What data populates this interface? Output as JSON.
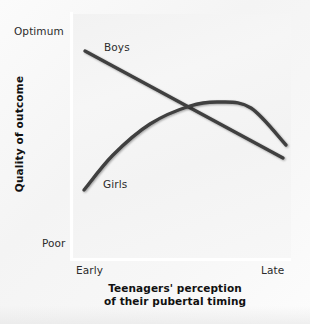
{
  "chart_data": {
    "type": "line",
    "title": "",
    "xlabel": "Teenagers' perception of their pubertal timing",
    "ylabel": "Quality of outcome",
    "x_tick_labels": [
      "Early",
      "Late"
    ],
    "y_tick_labels": [
      "Optimum",
      "Poor"
    ],
    "xlim": [
      "Early",
      "Late"
    ],
    "ylim": [
      "Poor",
      "Optimum"
    ],
    "grid": false,
    "legend_position": "inline-labels",
    "annotations": [
      "Boys",
      "Girls"
    ],
    "series": [
      {
        "name": "Boys",
        "shape": "straight descending line",
        "x": [
          0.06,
          0.28,
          0.52,
          0.76,
          0.97
        ],
        "y": [
          0.85,
          0.74,
          0.62,
          0.5,
          0.41
        ],
        "points_px": [
          [
            85,
            51
          ],
          [
            134,
            78
          ],
          [
            187,
            107
          ],
          [
            240,
            134
          ],
          [
            283,
            158
          ]
        ],
        "color": "#3f3f3f"
      },
      {
        "name": "Girls",
        "shape": "concave-down rising then slightly falling curve",
        "x": [
          0.05,
          0.18,
          0.34,
          0.52,
          0.66,
          0.8,
          0.98
        ],
        "y": [
          0.28,
          0.44,
          0.58,
          0.67,
          0.7,
          0.68,
          0.6
        ],
        "points_px": [
          [
            84,
            190
          ],
          [
            113,
            155
          ],
          [
            150,
            124
          ],
          [
            190,
            106
          ],
          [
            220,
            102
          ],
          [
            251,
            108
          ],
          [
            286,
            145
          ]
        ],
        "color": "#3f3f3f"
      }
    ],
    "crossing_point_px": [
      186,
      106
    ],
    "line_color": "#3f3f3f",
    "line_width_px": 3.4,
    "axis_color": "#ffffff",
    "plot_background": "#f4f4f4",
    "page_background": "#fbfbfb"
  },
  "axes": {
    "y_top_label": "Optimum",
    "y_bottom_label": "Poor",
    "x_left_label": "Early",
    "x_right_label": "Late",
    "y_title": "Quality of outcome",
    "x_title_line1": "Teenagers' perception",
    "x_title_line2": "of their pubertal timing"
  },
  "labels": {
    "boys": "Boys",
    "girls": "Girls"
  }
}
